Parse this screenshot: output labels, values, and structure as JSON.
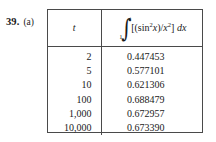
{
  "problem": {
    "number": "39.",
    "part": "(a)"
  },
  "table": {
    "headers": {
      "t_label": "t",
      "integral": {
        "symbol": "∫",
        "lower_limit": "1",
        "upper_limit": "t",
        "integrand_open": "[(sin",
        "integrand_exp1": "2",
        "integrand_var1": "x",
        "integrand_mid": ")/",
        "integrand_var2": "x",
        "integrand_exp2": "2",
        "integrand_close": "]",
        "differential": "dx"
      }
    },
    "rows": [
      {
        "t": "2",
        "value": "0.447453"
      },
      {
        "t": "5",
        "value": "0.577101"
      },
      {
        "t": "10",
        "value": "0.621306"
      },
      {
        "t": "100",
        "value": "0.688479"
      },
      {
        "t": "1,000",
        "value": "0.672957"
      },
      {
        "t": "10,000",
        "value": "0.673390"
      }
    ]
  },
  "chart_data": {
    "type": "table",
    "title": "",
    "columns": [
      "t",
      "∫₁ᵗ [(sin²x)/x²] dx"
    ],
    "x": [
      2,
      5,
      10,
      100,
      1000,
      10000
    ],
    "values": [
      0.447453,
      0.577101,
      0.621306,
      0.688479,
      0.672957,
      0.67339
    ],
    "xlabel": "t",
    "ylabel": "∫₁ᵗ [(sin²x)/x²] dx",
    "grid": false,
    "legend": "none"
  },
  "colors": {
    "background": "#ffffff",
    "text": "#1a1a1a",
    "rule": "#4a4a4a"
  }
}
